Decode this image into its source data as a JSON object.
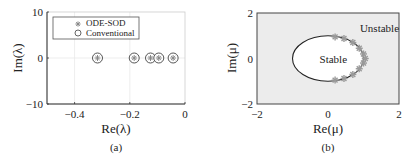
{
  "chart_data": [
    {
      "type": "scatter",
      "caption": "(a)",
      "xlabel": "Re(λ)",
      "ylabel": "Im(λ)",
      "xlim": [
        -0.5,
        0
      ],
      "ylim": [
        -10,
        10
      ],
      "xticks": [
        -0.4,
        -0.2,
        0
      ],
      "xtick_labels": [
        "−0.4",
        "−0.2",
        "0"
      ],
      "yticks": [
        -10,
        0,
        10
      ],
      "ytick_labels": [
        "−10",
        "0",
        "10"
      ],
      "grid": true,
      "legend_position": "top-left",
      "series": [
        {
          "name": "ODE-SOD",
          "marker": "asterisk",
          "x": [
            -0.317,
            -0.184,
            -0.125,
            -0.095,
            -0.043
          ],
          "y": [
            0,
            0,
            0,
            0,
            0
          ]
        },
        {
          "name": "Conventional",
          "marker": "circle",
          "x": [
            -0.317,
            -0.184,
            -0.125,
            -0.095,
            -0.043
          ],
          "y": [
            0,
            0,
            0,
            0,
            0
          ]
        }
      ]
    },
    {
      "type": "scatter",
      "caption": "(b)",
      "xlabel": "Re(μ)",
      "ylabel": "Im(μ)",
      "xlim": [
        -2,
        2
      ],
      "ylim": [
        -2,
        2
      ],
      "xticks": [
        -2,
        0,
        2
      ],
      "xtick_labels": [
        "−2",
        "0",
        "2"
      ],
      "yticks": [
        -2,
        0,
        2
      ],
      "ytick_labels": [
        "−2",
        "0",
        "2"
      ],
      "grid": false,
      "stability_boundary": {
        "shape": "circle",
        "center": [
          0,
          0
        ],
        "radius": 1
      },
      "region_labels": [
        {
          "text": "Stable",
          "x": 0.15,
          "y": 0
        },
        {
          "text": "Unstable",
          "x": 1.45,
          "y": 1.35
        }
      ],
      "series": [
        {
          "name": "scaled eigenvalues",
          "marker": "asterisk",
          "x": [
            0.2,
            0.45,
            0.7,
            0.88,
            1.0,
            1.05,
            1.0,
            0.88,
            0.7,
            0.45,
            0.2
          ],
          "y": [
            0.95,
            0.88,
            0.7,
            0.45,
            0.2,
            0.0,
            -0.2,
            -0.45,
            -0.7,
            -0.88,
            -0.95
          ]
        }
      ]
    }
  ],
  "colors": {
    "axis": "#333333",
    "frame": "#cccccc",
    "grid": "#e8e8e8",
    "marker_fill": "#888888",
    "unstable_region": "#ececec",
    "stable_region": "#ffffff",
    "boundary": "#222222"
  }
}
